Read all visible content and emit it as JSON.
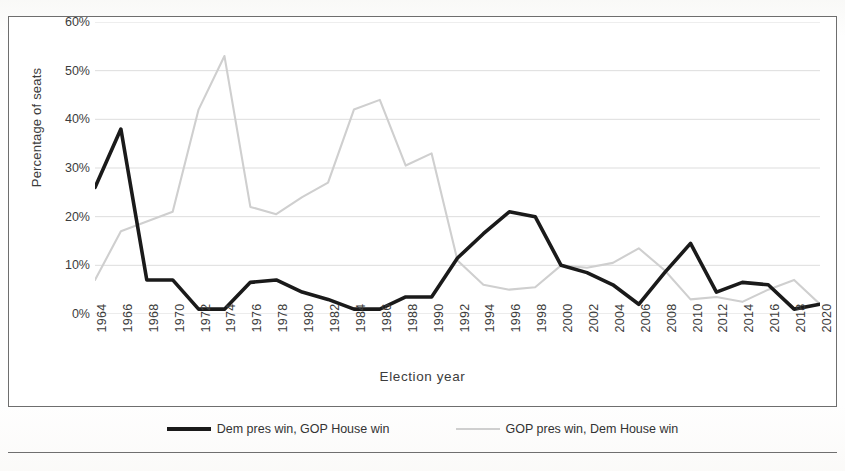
{
  "title": "",
  "axes": {
    "x_label": "Election  year",
    "y_label": "Percentage of seats",
    "y_ticks": [
      "0%",
      "10%",
      "20%",
      "30%",
      "40%",
      "50%",
      "60%"
    ]
  },
  "legend": {
    "items": [
      {
        "label": "Dem pres win, GOP House win",
        "style": "dark"
      },
      {
        "label": "GOP pres win, Dem House win",
        "style": "light"
      }
    ]
  },
  "colors": {
    "series_dark": "#1a1a1a",
    "series_light": "#cfcfcf",
    "gridline": "#d9d9d9",
    "frame": "#6e6e6e",
    "text": "#3c3c3c"
  },
  "chart_data": {
    "type": "line",
    "title": "",
    "xlabel": "Election  year",
    "ylabel": "Percentage of seats",
    "ylim": [
      0,
      60
    ],
    "ytick_step": 10,
    "grid": true,
    "legend_position": "bottom",
    "categories": [
      "1964",
      "1966",
      "1968",
      "1970",
      "1972",
      "1974",
      "1976",
      "1978",
      "1980",
      "1982",
      "1984",
      "1986",
      "1988",
      "1990",
      "1992",
      "1994",
      "1996",
      "1998",
      "2000",
      "2002",
      "2004",
      "2006",
      "2008",
      "2010",
      "2012",
      "2014",
      "2016",
      "2018",
      "2020"
    ],
    "series": [
      {
        "name": "Dem pres win, GOP House win",
        "color": "#1a1a1a",
        "values": [
          26,
          38,
          7,
          7,
          1,
          1,
          6.5,
          7,
          4.5,
          3,
          1,
          1,
          3.5,
          3.5,
          11.5,
          16.5,
          21,
          20,
          10,
          8.5,
          6,
          2,
          8.5,
          14.5,
          4.5,
          6.5,
          6,
          1,
          2
        ]
      },
      {
        "name": "GOP pres win, Dem House win",
        "color": "#cfcfcf",
        "values": [
          7,
          17,
          19,
          21,
          42,
          53,
          22,
          20.5,
          24,
          27,
          42,
          44,
          30.5,
          33,
          11,
          6,
          5,
          5.5,
          10,
          9.5,
          10.5,
          13.5,
          9,
          3,
          3.5,
          2.5,
          5,
          7,
          2
        ]
      }
    ]
  }
}
